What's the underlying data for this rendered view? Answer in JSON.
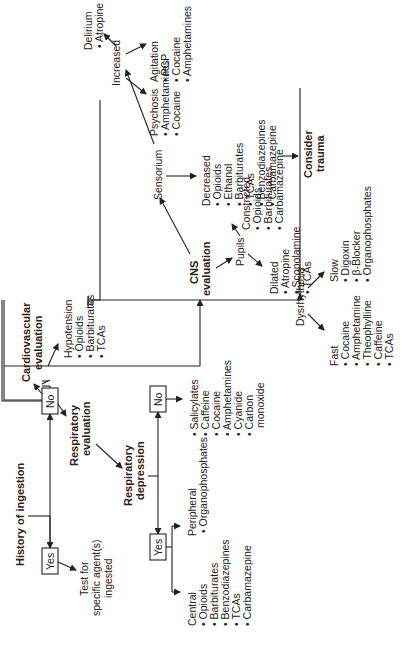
{
  "root": {
    "title": "History of ingestion"
  },
  "yes_branch": {
    "label": "Yes",
    "result_lines": [
      "Test for",
      "specific agent(s)",
      "ingested"
    ]
  },
  "no_branch": {
    "label": "No"
  },
  "respiratory": {
    "title_lines": [
      "Respiratory",
      "evaluation"
    ],
    "depression_lines": [
      "Respiratory",
      "depression"
    ],
    "yes_label": "Yes",
    "no_label": "No",
    "central": {
      "heading": "Central",
      "items": [
        "Opioids",
        "Barbiturates",
        "Benzodiazepines",
        "TCAs",
        "Carbamazepine"
      ]
    },
    "peripheral": {
      "heading": "Peripheral",
      "items": [
        "Organophosphates"
      ]
    },
    "no_items": [
      "Salicylates",
      "Caffeine",
      "Cocaine",
      "Amphetamines",
      "Cyanide",
      "Carbon",
      "monoxide"
    ]
  },
  "cardiovascular": {
    "title_lines": [
      "Cardiovascular",
      "evaluation"
    ],
    "hypotension": {
      "heading": "Hypotension",
      "items": [
        "Opioids",
        "Barbiturates",
        "TCAs"
      ]
    },
    "dysrhythmia": {
      "label": "Dysrhythmia",
      "fast": {
        "heading": "Fast",
        "items": [
          "Cocaine",
          "Amphetamine",
          "Theophylline",
          "Caffeine",
          "TCAs"
        ]
      },
      "slow": {
        "heading": "Slow",
        "items": [
          "Digoxin",
          "β-Blocker",
          "Organophosphates"
        ]
      }
    }
  },
  "cns": {
    "title_lines": [
      "CNS",
      "evaluation"
    ],
    "pupils": {
      "label": "Pupils",
      "dilated": {
        "heading": "Dilated",
        "items": [
          "Atropine",
          "Scopolamine",
          "TCAs"
        ]
      },
      "constricted": {
        "heading": "Constricted",
        "items": [
          "Opioids",
          "Barbiturates",
          "Carbamazepine"
        ]
      }
    },
    "sensorium": {
      "label": "Sensorium",
      "decreased": {
        "heading": "Decreased",
        "items": [
          "Opioids",
          "Ethanol",
          "Barbiturates",
          "TCAs",
          "Benzodiazepines",
          "Carbamazepine"
        ]
      },
      "consider_lines": [
        "Consider",
        "trauma"
      ],
      "increased": {
        "label": "Increased",
        "psychosis": {
          "heading": "Psychosis",
          "items": [
            "Amphetamines",
            "Cocaine"
          ]
        },
        "agitation": {
          "heading": "Agitation",
          "items": [
            "PCP",
            "Cocaine",
            "Amphetamines"
          ]
        },
        "delirium": {
          "heading": "Delirium",
          "items": [
            "Atropine"
          ]
        }
      }
    }
  },
  "bullet": "•"
}
